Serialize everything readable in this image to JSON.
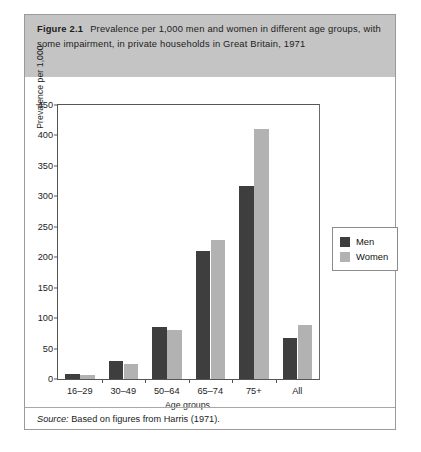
{
  "figure": {
    "label": "Figure 2.1",
    "caption": "Prevalence per 1,000 men and women in different age groups, with some impairment, in private households in Great Britain, 1971",
    "source_word": "Source:",
    "source_text": "Based on figures from Harris (1971)."
  },
  "legend": {
    "position": "right-inside",
    "items": [
      {
        "label": "Men",
        "color": "#3e3e3e"
      },
      {
        "label": "Women",
        "color": "#b2b2b2"
      }
    ]
  },
  "colors": {
    "men": "#3e3e3e",
    "women": "#b2b2b2",
    "caption_band": "#c4c4c4",
    "frame": "#9a9a9a",
    "axis": "#555555"
  },
  "chart_data": {
    "type": "bar",
    "title": "Prevalence per 1,000 men and women in different age groups, with some impairment, in private households in Great Britain, 1971",
    "xlabel": "Age groups",
    "ylabel": "Prevalence per 1,000",
    "categories": [
      "16–29",
      "30–49",
      "50–64",
      "65–74",
      "75+",
      "All"
    ],
    "series": [
      {
        "name": "Men",
        "color": "#3e3e3e",
        "values": [
          8,
          30,
          85,
          211,
          317,
          67
        ]
      },
      {
        "name": "Women",
        "color": "#b2b2b2",
        "values": [
          6,
          25,
          81,
          228,
          410,
          88
        ]
      }
    ],
    "ylim": [
      0,
      450
    ],
    "yticks": [
      0,
      50,
      100,
      150,
      200,
      250,
      300,
      350,
      400,
      450
    ],
    "ytick_labels": [
      "0",
      "50",
      "100",
      "150",
      "200",
      "250",
      "300",
      "350",
      "400",
      "450"
    ],
    "grid": false,
    "legend_position": "right"
  }
}
